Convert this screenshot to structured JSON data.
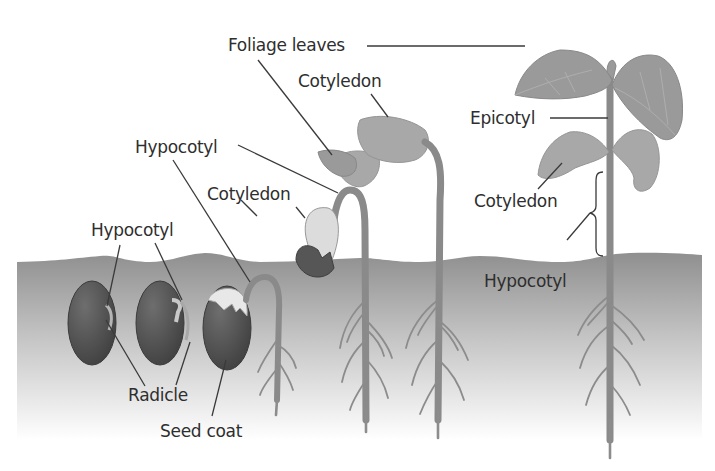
{
  "diagram": {
    "colors": {
      "background": "#ffffff",
      "soil_top": "#8f8f8f",
      "soil_bottom": "#ffffff",
      "seed": "#4f4f4f",
      "plant": "#9a9a9a",
      "label_text": "#2e2e2e"
    },
    "labels": {
      "foliage_leaves": "Foliage leaves",
      "cotyledon_stage4": "Cotyledon",
      "hypocotyl_stage3": "Hypocotyl",
      "cotyledon_stage3": "Cotyledon",
      "hypocotyl_stage1": "Hypocotyl",
      "radicle": "Radicle",
      "seed_coat": "Seed coat",
      "epicotyl": "Epicotyl",
      "cotyledon_stage5": "Cotyledon",
      "hypocotyl_stage5": "Hypocotyl"
    },
    "stages": [
      {
        "id": 1,
        "description": "Seed with emerging radicle"
      },
      {
        "id": 2,
        "description": "Seed with radicle elongating"
      },
      {
        "id": 3,
        "description": "Hypocotyl hook emerging from seed coat"
      },
      {
        "id": 4,
        "description": "Hypocotyl hook above soil, seed coat shed"
      },
      {
        "id": 5,
        "description": "Cotyledons and foliage leaves opening"
      },
      {
        "id": 6,
        "description": "Mature seedling with epicotyl and foliage leaves"
      }
    ]
  }
}
